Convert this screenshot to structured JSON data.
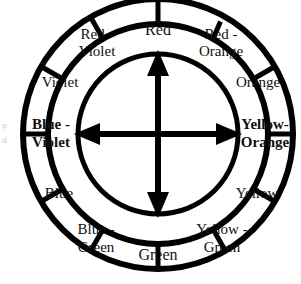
{
  "figure": {
    "name": "color-wheel",
    "segment_count": 12,
    "stroke_color": "#000000",
    "fill_color": "#ffffff",
    "text_color": "#111111"
  },
  "segments": [
    {
      "label_line1": "Red",
      "label_line2": "",
      "angle_deg": 0,
      "emphasis": "normal"
    },
    {
      "label_line1": "Red -",
      "label_line2": "Orange",
      "angle_deg": 30,
      "emphasis": "normal"
    },
    {
      "label_line1": "Orange",
      "label_line2": "",
      "angle_deg": 60,
      "emphasis": "normal"
    },
    {
      "label_line1": "Yellow-",
      "label_line2": "Orange",
      "angle_deg": 90,
      "emphasis": "primary"
    },
    {
      "label_line1": "Yellow",
      "label_line2": "",
      "angle_deg": 120,
      "emphasis": "normal"
    },
    {
      "label_line1": "Yellow -",
      "label_line2": "Green",
      "angle_deg": 150,
      "emphasis": "normal"
    },
    {
      "label_line1": "Green",
      "label_line2": "",
      "angle_deg": 180,
      "emphasis": "normal"
    },
    {
      "label_line1": "Blue -",
      "label_line2": "Green",
      "angle_deg": 210,
      "emphasis": "normal"
    },
    {
      "label_line1": "Blue",
      "label_line2": "",
      "angle_deg": 240,
      "emphasis": "normal"
    },
    {
      "label_line1": "Blue -",
      "label_line2": "Violet",
      "angle_deg": 270,
      "emphasis": "primary"
    },
    {
      "label_line1": "Violet",
      "label_line2": "",
      "angle_deg": 300,
      "emphasis": "normal"
    },
    {
      "label_line1": "Red -",
      "label_line2": "Violet",
      "angle_deg": 330,
      "emphasis": "normal"
    }
  ],
  "arrows": [
    {
      "name": "vertical-complement-arrow",
      "from": "Red",
      "to": "Green",
      "orientation": "vertical",
      "double_headed": true
    },
    {
      "name": "horizontal-complement-arrow",
      "from": "Blue - Violet",
      "to": "Yellow-Orange",
      "orientation": "horizontal",
      "double_headed": true
    }
  ],
  "edge_artifact": {
    "line1": "y:",
    "line2": "d."
  }
}
